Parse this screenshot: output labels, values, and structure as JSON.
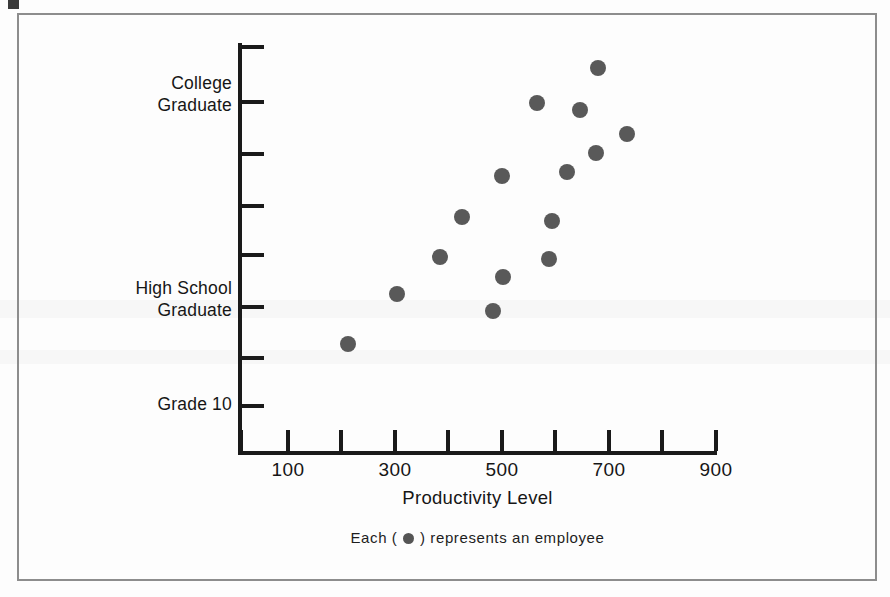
{
  "figure": {
    "x_axis_title": "Productivity Level",
    "caption_before": "Each (",
    "caption_after": ") represents an employee",
    "marker_color": "#595959",
    "axis_color": "#1a1a1a",
    "frame_color": "#8d8d8d"
  },
  "chart_data": {
    "type": "scatter",
    "title": "",
    "xlabel": "Productivity Level",
    "ylabel": "",
    "xlim": [
      0,
      1000
    ],
    "grid": false,
    "legend": "Each ( ● ) represents an employee",
    "x_ticks": [
      100,
      200,
      300,
      400,
      500,
      600,
      700,
      800,
      900,
      1000
    ],
    "x_tick_labels": [
      "100",
      "",
      "300",
      "",
      "500",
      "",
      "700",
      "",
      "900",
      ""
    ],
    "y_category_labels": [
      "College Graduate",
      "High School Graduate",
      "Grade 10"
    ],
    "y_tick_count": 8,
    "points": [
      {
        "x": 680,
        "y_px": 68,
        "education": "College Graduate"
      },
      {
        "x": 566,
        "y_px": 103,
        "education": "College Graduate"
      },
      {
        "x": 647,
        "y_px": 110,
        "education": "College Graduate"
      },
      {
        "x": 735,
        "y_px": 134,
        "education": "College Graduate"
      },
      {
        "x": 677,
        "y_px": 153,
        "education": "College Graduate"
      },
      {
        "x": 622,
        "y_px": 172,
        "education": "College Graduate"
      },
      {
        "x": 500,
        "y_px": 176,
        "education": "College Graduate"
      },
      {
        "x": 425,
        "y_px": 217,
        "education": "College Graduate"
      },
      {
        "x": 594,
        "y_px": 221,
        "education": "College Graduate"
      },
      {
        "x": 384,
        "y_px": 257,
        "education": "High School Graduate"
      },
      {
        "x": 588,
        "y_px": 259,
        "education": "High School Graduate"
      },
      {
        "x": 503,
        "y_px": 277,
        "education": "High School Graduate"
      },
      {
        "x": 305,
        "y_px": 294,
        "education": "High School Graduate"
      },
      {
        "x": 483,
        "y_px": 311,
        "education": "High School Graduate"
      },
      {
        "x": 213,
        "y_px": 344,
        "education": "High School Graduate"
      }
    ]
  },
  "y_labels": [
    {
      "text": "College\nGraduate",
      "top": 72
    },
    {
      "text": "High School\nGraduate",
      "top": 277
    },
    {
      "text": "Grade 10",
      "top": 393
    }
  ],
  "x_tick_labels": [
    {
      "text": "100",
      "center": 288
    },
    {
      "text": "300",
      "center": 395
    },
    {
      "text": "500",
      "center": 502
    },
    {
      "text": "700",
      "center": 609
    },
    {
      "text": "900",
      "center": 716
    }
  ],
  "y_tick_positions": [
    45,
    100,
    152,
    204,
    253,
    305,
    356,
    404
  ],
  "x_tick_positions": [
    288,
    341,
    395,
    448,
    502,
    555,
    609,
    662,
    716,
    241
  ]
}
